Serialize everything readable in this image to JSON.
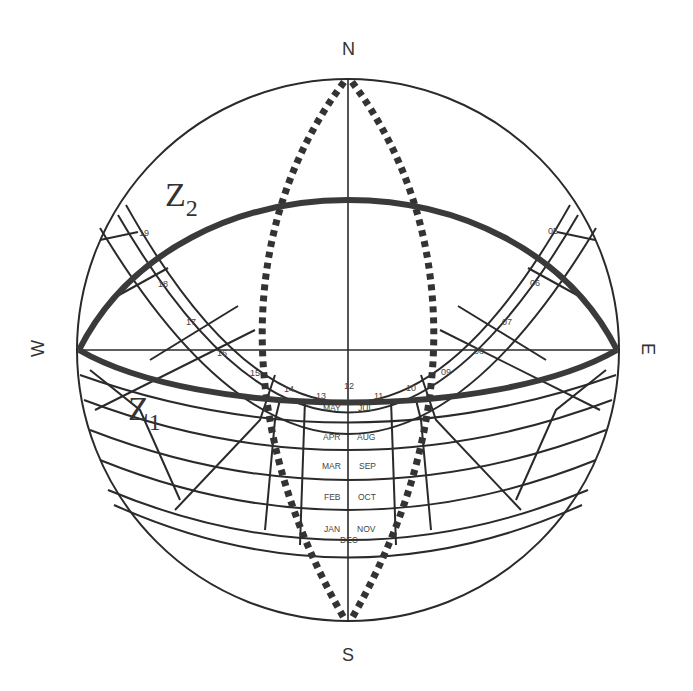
{
  "diagram": {
    "cardinals": {
      "north": "N",
      "south": "S",
      "east": "E",
      "west": "W"
    },
    "curves": {
      "z1": {
        "label": "Z",
        "subscript": "1"
      },
      "z2": {
        "label": "Z",
        "subscript": "2"
      }
    },
    "hour_labels": [
      "05",
      "06",
      "07",
      "08",
      "09",
      "10",
      "11",
      "12",
      "13",
      "14",
      "15",
      "16",
      "17",
      "18",
      "19"
    ],
    "month_labels": {
      "left": [
        "MAY",
        "APR",
        "MAR",
        "FEB",
        "JAN"
      ],
      "right": [
        "JUL",
        "AUG",
        "SEP",
        "OCT",
        "NOV"
      ],
      "bottom": "DEC"
    },
    "colors": {
      "line": "#2a2a2a",
      "thick_curve": "#3a3a3a",
      "dotted": "#333333",
      "background": "#ffffff"
    }
  }
}
